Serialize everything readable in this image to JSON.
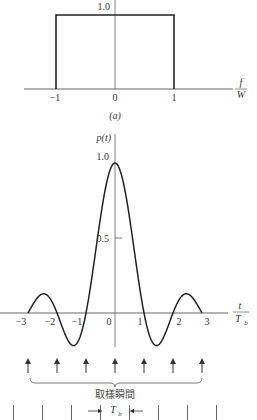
{
  "colors": {
    "background": "#ffffff",
    "axis": "#555555",
    "curve": "#222222",
    "text": "#333333"
  },
  "panel_a": {
    "caption": "(a)",
    "y_tick_label": "1.0",
    "x_axis_label_num": "f",
    "x_axis_label_den": "W",
    "x_ticks": [
      "−1",
      "0",
      "1"
    ]
  },
  "panel_b": {
    "y_axis_label": "p(t)",
    "y_tick_labels": [
      "1.0",
      "0.5"
    ],
    "x_axis_label_num": "t",
    "x_axis_label_den": "T",
    "x_axis_label_sub": "b",
    "x_ticks": [
      "−3",
      "−2",
      "−1",
      "0",
      "1",
      "2",
      "3"
    ],
    "sampling_label": "取樣瞬間",
    "interval_label": "T",
    "interval_sub": "b"
  },
  "chart_data": [
    {
      "type": "line",
      "title": "(a)",
      "xlabel": "f/W",
      "ylabel": "",
      "x": [
        -1.5,
        -1,
        -1,
        1,
        1,
        1.9
      ],
      "values": [
        0,
        0,
        1,
        1,
        0,
        0
      ],
      "xlim": [
        -1.5,
        1.9
      ],
      "ylim": [
        0,
        1.05
      ],
      "x_tick_labels": [
        "-1",
        "0",
        "1"
      ],
      "y_tick_labels": [
        "1.0"
      ],
      "grid": false,
      "description": "Rectangular spectrum, 1.0 for |f/W| < 1, 0 otherwise"
    },
    {
      "type": "line",
      "title": "p(t)",
      "xlabel": "t/T_b",
      "ylabel": "p(t)",
      "x": [
        -3,
        -2.5,
        -2,
        -1.5,
        -1.43,
        -1,
        -0.5,
        0,
        0.5,
        1,
        1.43,
        1.5,
        2,
        2.5,
        3
      ],
      "values": [
        0,
        0.127,
        0,
        -0.212,
        -0.217,
        0,
        0.637,
        1.0,
        0.637,
        0,
        -0.217,
        -0.212,
        0,
        0.127,
        0
      ],
      "xlim": [
        -3,
        3
      ],
      "ylim": [
        -0.25,
        1.0
      ],
      "x_tick_labels": [
        "-3",
        "-2",
        "-1",
        "0",
        "1",
        "2",
        "3"
      ],
      "y_tick_labels": [
        "0.5",
        "1.0"
      ],
      "grid": false,
      "annotations": [
        "Sampling instants arrows at t = -3..3 labeled 取樣瞬間",
        "Interval T_b marked between adjacent ticks"
      ],
      "description": "Sinc pulse p(t) = sin(pi t/T_b)/(pi t/T_b)"
    }
  ]
}
